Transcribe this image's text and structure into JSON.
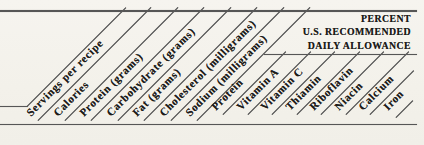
{
  "table_header": {
    "columns": [
      {
        "label": "Servings per recipe"
      },
      {
        "label": "Calories"
      },
      {
        "label": "Protein (grams)"
      },
      {
        "label": "Carbohydrate (grams)"
      },
      {
        "label": "Fat (grams)"
      },
      {
        "label": "Cholesterol (milligrams)"
      },
      {
        "label": "Sodium (milligrams)"
      },
      {
        "label": "Protein"
      },
      {
        "label": "Vitamin A"
      },
      {
        "label": "Vitamin C"
      },
      {
        "label": "Thiamin"
      },
      {
        "label": "Riboflavin"
      },
      {
        "label": "Niacin"
      },
      {
        "label": "Calcium"
      },
      {
        "label": "Iron"
      }
    ],
    "percent_block": {
      "line1": "PERCENT",
      "line2": "U.S. RECOMMENDED",
      "line3": "DAILY ALLOWANCE"
    }
  },
  "colors": {
    "background": "#f4f2ec",
    "rule": "#565656",
    "text": "#1d1c1a"
  }
}
